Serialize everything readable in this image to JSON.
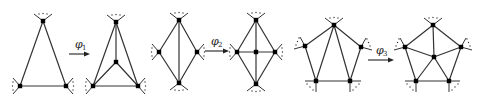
{
  "diagram": {
    "colors": {
      "line": "#333333",
      "node": "#000000",
      "background": "#ffffff"
    },
    "transformations": [
      {
        "name": "phi1",
        "label": "φ",
        "subscript": "1",
        "before": {
          "shape": "triangle",
          "nodes": [
            "top",
            "bottom-left",
            "bottom-right"
          ],
          "edges": [
            [
              "top",
              "bottom-left"
            ],
            [
              "top",
              "bottom-right"
            ],
            [
              "bottom-left",
              "bottom-right"
            ]
          ]
        },
        "after": {
          "shape": "triangle-with-center",
          "nodes": [
            "top",
            "bottom-left",
            "bottom-right",
            "center"
          ],
          "edges": [
            [
              "top",
              "bottom-left"
            ],
            [
              "top",
              "bottom-right"
            ],
            [
              "bottom-left",
              "bottom-right"
            ],
            [
              "center",
              "top"
            ],
            [
              "center",
              "bottom-left"
            ],
            [
              "center",
              "bottom-right"
            ]
          ]
        }
      },
      {
        "name": "phi2",
        "label": "φ",
        "subscript": "2",
        "before": {
          "shape": "diamond",
          "nodes": [
            "top",
            "left",
            "right",
            "bottom"
          ],
          "edges": [
            [
              "top",
              "left"
            ],
            [
              "top",
              "right"
            ],
            [
              "left",
              "bottom"
            ],
            [
              "right",
              "bottom"
            ],
            [
              "top",
              "bottom"
            ]
          ]
        },
        "after": {
          "shape": "diamond-with-center",
          "nodes": [
            "top",
            "left",
            "right",
            "bottom",
            "center"
          ],
          "edges": [
            [
              "top",
              "left"
            ],
            [
              "top",
              "right"
            ],
            [
              "left",
              "bottom"
            ],
            [
              "right",
              "bottom"
            ],
            [
              "center",
              "top"
            ],
            [
              "center",
              "bottom"
            ],
            [
              "center",
              "left"
            ],
            [
              "center",
              "right"
            ]
          ]
        }
      },
      {
        "name": "phi3",
        "label": "φ",
        "subscript": "3",
        "before": {
          "shape": "pentagon",
          "nodes": [
            "top",
            "left",
            "right",
            "bottom-left",
            "bottom-right"
          ],
          "edges": [
            [
              "top",
              "left"
            ],
            [
              "top",
              "right"
            ],
            [
              "left",
              "bottom-left"
            ],
            [
              "right",
              "bottom-right"
            ],
            [
              "bottom-left",
              "bottom-right"
            ],
            [
              "top",
              "bottom-left"
            ],
            [
              "top",
              "bottom-right"
            ]
          ]
        },
        "after": {
          "shape": "pentagon-with-center",
          "nodes": [
            "top",
            "left",
            "right",
            "bottom-left",
            "bottom-right",
            "center"
          ],
          "edges": [
            [
              "top",
              "left"
            ],
            [
              "top",
              "right"
            ],
            [
              "left",
              "bottom-left"
            ],
            [
              "right",
              "bottom-right"
            ],
            [
              "bottom-left",
              "bottom-right"
            ],
            [
              "center",
              "top"
            ],
            [
              "center",
              "left"
            ],
            [
              "center",
              "right"
            ],
            [
              "center",
              "bottom-left"
            ],
            [
              "center",
              "bottom-right"
            ]
          ]
        }
      }
    ]
  }
}
